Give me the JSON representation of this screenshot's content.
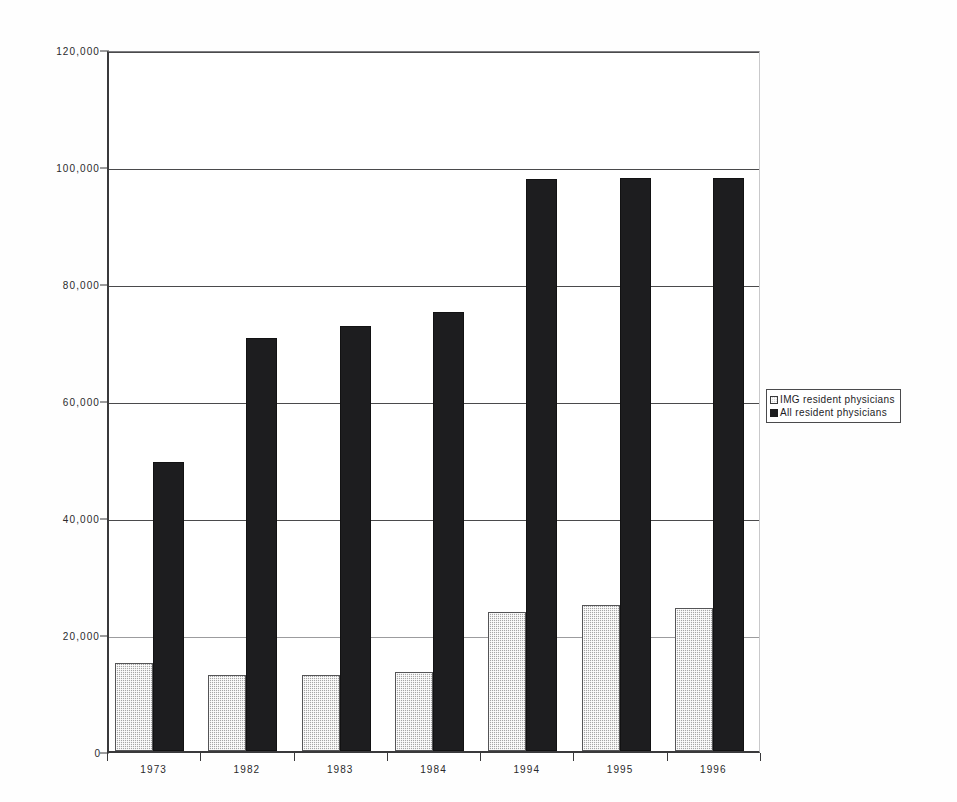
{
  "chart_data": {
    "type": "bar",
    "title": "",
    "subtitle": "",
    "xlabel": "",
    "ylabel": "",
    "categories": [
      "1973",
      "1982",
      "1983",
      "1984",
      "1994",
      "1995",
      "1996"
    ],
    "series": [
      {
        "name": "IMG resident physicians",
        "color": "#a6a6a6",
        "pattern": "gray-dither",
        "values": [
          15000,
          13000,
          13000,
          13500,
          23700,
          25000,
          24500
        ]
      },
      {
        "name": "All resident physicians",
        "color": "#1d1d1f",
        "pattern": "solid-black",
        "values": [
          49400,
          70600,
          72600,
          75000,
          97800,
          98000,
          97900
        ]
      }
    ],
    "ylim": [
      0,
      120000
    ],
    "yticks": [
      0,
      20000,
      40000,
      60000,
      80000,
      100000,
      120000
    ],
    "ytick_labels": [
      "0",
      "20,000",
      "40,000",
      "60,000",
      "80,000",
      "100,000",
      "120,000"
    ],
    "grid": "horizontal",
    "legend_position": "right-outside",
    "legend_entries": [
      "IMG resident physicians",
      "All resident physicians"
    ]
  },
  "legend": {
    "items": [
      {
        "label": "IMG resident physicians",
        "swatch": "legend-swatch-img"
      },
      {
        "label": "All resident physicians",
        "swatch": "legend-swatch-all"
      }
    ]
  },
  "axes": {
    "y": {
      "labels": [
        "120,000",
        "100,000",
        "80,000",
        "60,000",
        "40,000",
        "20,000",
        "0"
      ],
      "values": [
        120000,
        100000,
        80000,
        60000,
        40000,
        20000,
        0
      ]
    },
    "x": {
      "labels": [
        "1973",
        "1982",
        "1983",
        "1984",
        "1994",
        "1995",
        "1996"
      ]
    }
  }
}
